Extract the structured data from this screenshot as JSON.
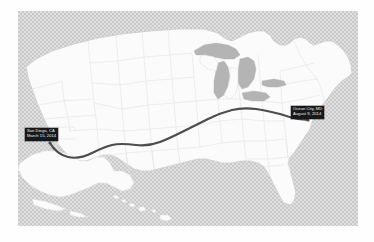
{
  "map": {
    "title_present": false,
    "region": "Contiguous United States with Alaska and Hawaii insets",
    "colors": {
      "page_background": "#ffffff",
      "ocean_background": "#c9c9c9",
      "land_fill": "#fbfbfb",
      "state_border": "#e2e2e2",
      "national_border": "#cfcfcf",
      "great_lakes_fill": "#b4b4b4",
      "route_line": "#4d4d4d",
      "label_background": "#17181a",
      "label_text": "#f2f2f2"
    },
    "route": {
      "name": "cross-country-route",
      "style": "solid",
      "stroke_width_px": 2.2,
      "origin_label_ref": "start",
      "destination_label_ref": "end"
    },
    "labels": [
      {
        "id": "start",
        "name": "route-start-label",
        "place": "San Diego, CA",
        "date": "March 15, 2014"
      },
      {
        "id": "end",
        "name": "route-end-label",
        "place": "Ocean City, MD",
        "date": "August 9, 2014"
      }
    ],
    "insets": [
      {
        "name": "alaska-inset",
        "label": ""
      },
      {
        "name": "hawaii-inset",
        "label": ""
      }
    ]
  }
}
